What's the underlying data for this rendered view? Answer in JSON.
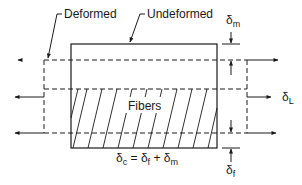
{
  "diagram": {
    "labels": {
      "deformed": "Deformed",
      "undeformed": "Undeformed",
      "fibers": "Fibers",
      "delta_m": "δ",
      "delta_m_sub": "m",
      "delta_L": "δ",
      "delta_L_sub": "L",
      "delta_f": "δ",
      "delta_f_sub": "f",
      "equation": {
        "lhs": "δ",
        "lhs_sub": "c",
        "eq": " = ",
        "t1": "δ",
        "t1_sub": "f",
        "plus": " + ",
        "t2": "δ",
        "t2_sub": "m"
      }
    },
    "colors": {
      "line": "#1a1a1a",
      "background": "#ffffff"
    }
  }
}
